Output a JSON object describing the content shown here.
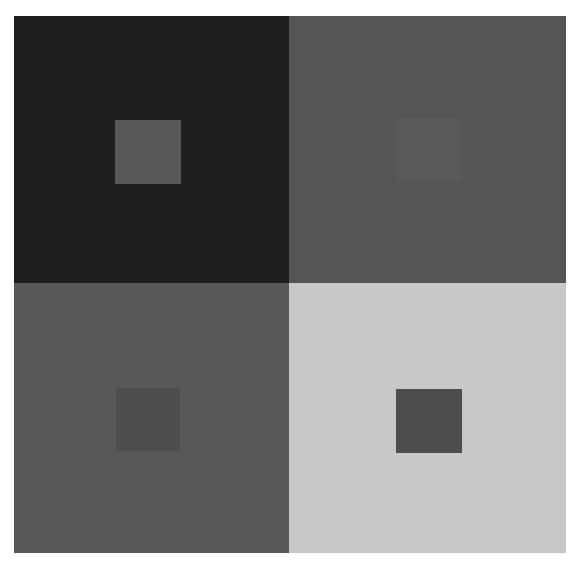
{
  "figure": {
    "quadrants": [
      {
        "position": "top-left",
        "background": "#1e1e1e",
        "square": "#575757"
      },
      {
        "position": "top-right",
        "background": "#555555",
        "square": "#5a5a5a"
      },
      {
        "position": "bottom-left",
        "background": "#585858",
        "square": "#4e4e4e"
      },
      {
        "position": "bottom-right",
        "background": "#c8c8c8",
        "square": "#4d4d4d"
      }
    ]
  }
}
